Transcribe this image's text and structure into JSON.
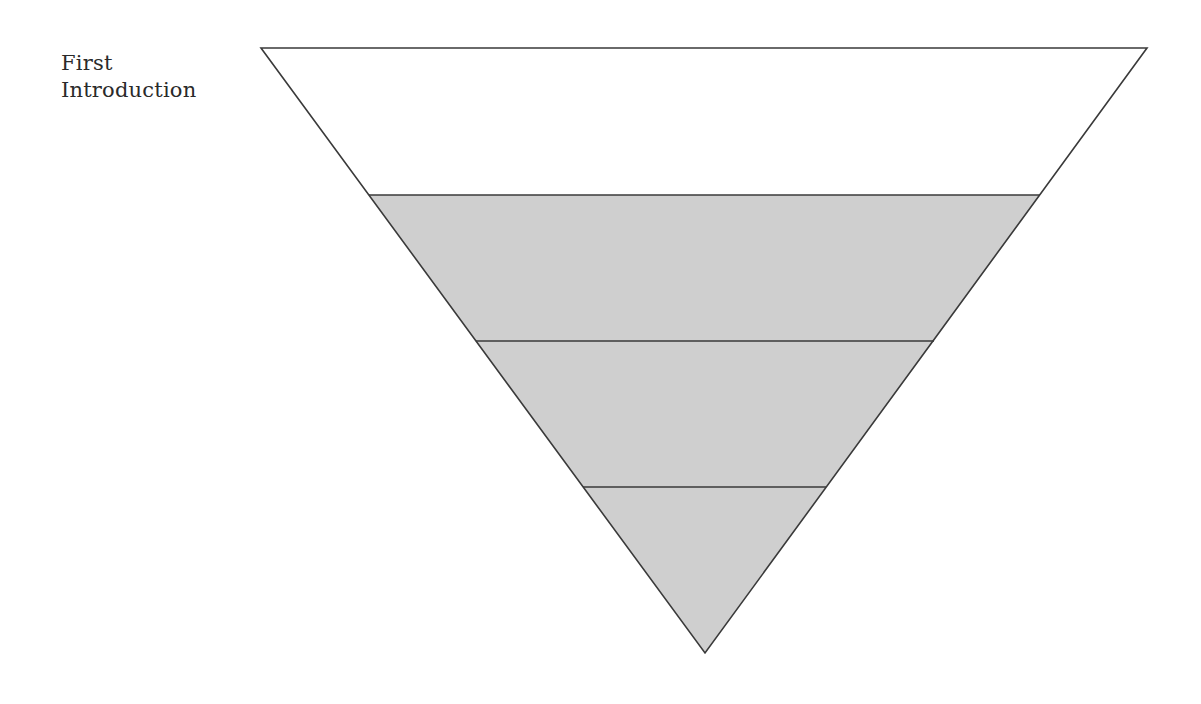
{
  "diagram": {
    "type": "inverted-triangle-funnel",
    "label": "First\nIntroduction",
    "colors": {
      "background": "#ffffff",
      "top_band_fill": "#ffffff",
      "lower_band_fill": "#cfcfcf",
      "stroke": "#3a3a3a",
      "text": "#2a2a2a"
    },
    "bands": [
      {
        "index": 1,
        "fill": "white"
      },
      {
        "index": 2,
        "fill": "gray"
      },
      {
        "index": 3,
        "fill": "gray"
      },
      {
        "index": 4,
        "fill": "gray"
      }
    ]
  }
}
